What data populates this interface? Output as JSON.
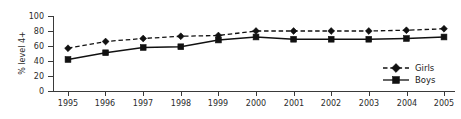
{
  "chart_data": {
    "type": "line",
    "title": "",
    "xlabel": "",
    "ylabel": "% level 4+",
    "categories": [
      "1995",
      "1996",
      "1997",
      "1998",
      "1999",
      "2000",
      "2001",
      "2002",
      "2003",
      "2004",
      "2005"
    ],
    "x": [
      1995,
      1996,
      1997,
      1998,
      1999,
      2000,
      2001,
      2002,
      2003,
      2004,
      2005
    ],
    "series": [
      {
        "name": "Girls",
        "marker": "diamond",
        "linestyle": "dashed",
        "color": "#111111",
        "values": [
          57,
          66,
          70,
          73,
          74,
          80,
          80,
          80,
          80,
          81,
          83
        ]
      },
      {
        "name": "Boys",
        "marker": "square",
        "linestyle": "solid",
        "color": "#111111",
        "values": [
          42,
          51,
          58,
          59,
          68,
          72,
          69,
          69,
          69,
          70,
          72
        ]
      }
    ],
    "ylim": [
      0,
      100
    ],
    "yticks": [
      0,
      20,
      40,
      60,
      80,
      100
    ],
    "ytick_labels": [
      "0",
      "20",
      "40",
      "60",
      "80",
      "100"
    ],
    "grid": false,
    "legend_position": "right-inside-bottom"
  },
  "legend": {
    "entries": [
      {
        "label": "Girls"
      },
      {
        "label": "Boys"
      }
    ]
  },
  "axes": {
    "y_axis_title": "% level 4+"
  }
}
